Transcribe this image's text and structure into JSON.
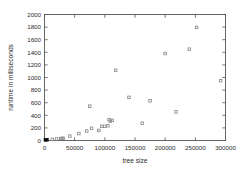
{
  "chart_data": {
    "type": "scatter",
    "title": "",
    "subtitle": "",
    "xlabel": "tree size",
    "ylabel": "runtime in milliseconds",
    "xlim": [
      0,
      300000
    ],
    "ylim": [
      0,
      2000
    ],
    "grid": false,
    "legend": false,
    "legend_position": "none",
    "marker": "open-square",
    "marker_color": "#8a8a8a",
    "xticks": [
      0,
      50000,
      100000,
      150000,
      200000,
      250000,
      300000
    ],
    "xtick_labels": [
      "0",
      "50000",
      "100000",
      "150000",
      "200000",
      "250000",
      "300000"
    ],
    "yticks": [
      0,
      200,
      400,
      600,
      800,
      1000,
      1200,
      1400,
      1600,
      1800,
      2000
    ],
    "ytick_labels": [
      "0",
      "200",
      "400",
      "600",
      "800",
      "1000",
      "1200",
      "1400",
      "1600",
      "1800",
      "2000"
    ],
    "series": [
      {
        "name": "runtime",
        "points": [
          {
            "x": 1500,
            "y": 10,
            "filled": true
          },
          {
            "x": 4000,
            "y": 12,
            "filled": true
          },
          {
            "x": 13000,
            "y": 18
          },
          {
            "x": 20000,
            "y": 25
          },
          {
            "x": 27000,
            "y": 30
          },
          {
            "x": 29000,
            "y": 32
          },
          {
            "x": 31000,
            "y": 35
          },
          {
            "x": 42000,
            "y": 70
          },
          {
            "x": 57000,
            "y": 110
          },
          {
            "x": 70000,
            "y": 150
          },
          {
            "x": 75000,
            "y": 545
          },
          {
            "x": 78000,
            "y": 195
          },
          {
            "x": 90000,
            "y": 160
          },
          {
            "x": 95000,
            "y": 225
          },
          {
            "x": 100000,
            "y": 225
          },
          {
            "x": 105000,
            "y": 235
          },
          {
            "x": 107000,
            "y": 330
          },
          {
            "x": 109000,
            "y": 305
          },
          {
            "x": 112000,
            "y": 320
          },
          {
            "x": 118000,
            "y": 1115
          },
          {
            "x": 140000,
            "y": 685
          },
          {
            "x": 162000,
            "y": 275
          },
          {
            "x": 175000,
            "y": 630
          },
          {
            "x": 200000,
            "y": 1380
          },
          {
            "x": 218000,
            "y": 455
          },
          {
            "x": 240000,
            "y": 1450
          },
          {
            "x": 252000,
            "y": 1795
          },
          {
            "x": 292000,
            "y": 950
          }
        ]
      }
    ]
  },
  "colors": {
    "axis": "#555555",
    "text": "#2b2b2b",
    "marker": "#8a8a8a",
    "marker_filled": "#111111",
    "background": "#ffffff"
  }
}
